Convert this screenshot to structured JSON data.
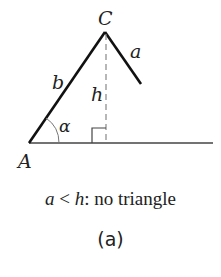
{
  "diagram": {
    "labels": {
      "vertex_c": "C",
      "vertex_a": "A",
      "side_a": "a",
      "side_b": "b",
      "height": "h",
      "angle": "α"
    },
    "caption": {
      "var_a": "a",
      "relation": " < ",
      "var_h": "h",
      "text": ": no triangle"
    },
    "sublabel": "(a)",
    "colors": {
      "line": "#111111",
      "dashed": "#888888",
      "text": "#222222"
    }
  }
}
